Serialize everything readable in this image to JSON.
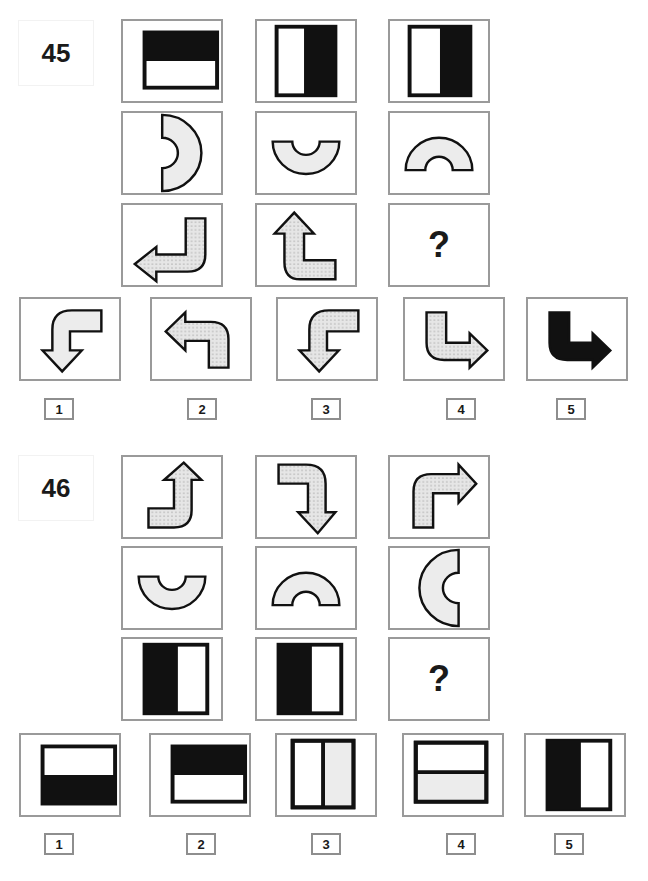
{
  "colors": {
    "black": "#111111",
    "light_fill": "#ececec",
    "dotted_fill": "#e6e6e6",
    "cell_border": "#9a9a9a"
  },
  "puzzles": [
    {
      "number": "45",
      "grid": [
        [
          "rect-top-black",
          "rect-right-black",
          "rect-right-black-wide"
        ],
        [
          "arc-right",
          "arc-bottom",
          "arc-top"
        ],
        [
          "arrow-up-turn-left-dotted",
          "arrow-right-turn-up-dotted",
          "question"
        ]
      ],
      "question_mark": "?",
      "options": [
        {
          "label": "1",
          "shape": "arrow-right-turn-down-light"
        },
        {
          "label": "2",
          "shape": "arrow-down-turn-left-dotted"
        },
        {
          "label": "3",
          "shape": "arrow-right-turn-down-dotted"
        },
        {
          "label": "4",
          "shape": "arrow-up-turn-right-dotted"
        },
        {
          "label": "5",
          "shape": "arrow-up-turn-right-black"
        }
      ]
    },
    {
      "number": "46",
      "grid": [
        [
          "arrow-left-turn-up-dotted",
          "arrow-left-turn-down-dotted",
          "arrow-down-turn-right-dotted"
        ],
        [
          "arc-bottom",
          "arc-top",
          "arc-left"
        ],
        [
          "rect-left-black",
          "rect-left-black",
          "question"
        ]
      ],
      "question_mark": "?",
      "options": [
        {
          "label": "1",
          "shape": "rect-bottom-black"
        },
        {
          "label": "2",
          "shape": "rect-top-black"
        },
        {
          "label": "3",
          "shape": "rect-split-vertical-light"
        },
        {
          "label": "4",
          "shape": "rect-split-horizontal-light"
        },
        {
          "label": "5",
          "shape": "rect-left-black"
        }
      ]
    }
  ]
}
